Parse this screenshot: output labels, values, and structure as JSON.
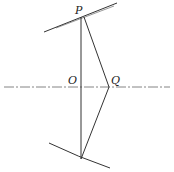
{
  "diagram": {
    "labels": {
      "P": "P",
      "O": "O",
      "Q": "Q"
    },
    "colors": {
      "line": "#333333",
      "axis": "#666666",
      "background": "#ffffff"
    }
  }
}
